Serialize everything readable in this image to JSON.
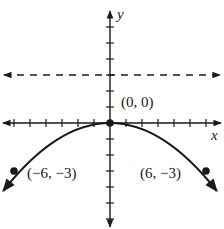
{
  "graph": {
    "x_axis_label": "x",
    "y_axis_label": "y",
    "tick_unit": 1,
    "x_range": [
      -6.5,
      6.5
    ],
    "y_range": [
      -6.5,
      6.5
    ],
    "directrix": {
      "equation": "y = 3",
      "style": "dashed"
    },
    "curve": {
      "type": "parabola",
      "equation": "y = -x^2/12",
      "opens": "down"
    },
    "points": [
      {
        "name": "vertex",
        "label": "(0, 0)",
        "x": 0,
        "y": 0
      },
      {
        "name": "left-point",
        "label": "(−6, −3)",
        "x": -6,
        "y": -3
      },
      {
        "name": "right-point",
        "label": "(6, −3)",
        "x": 6,
        "y": -3
      }
    ],
    "colors": {
      "ink": "#1a1a1a",
      "background": "#ffffff"
    }
  }
}
